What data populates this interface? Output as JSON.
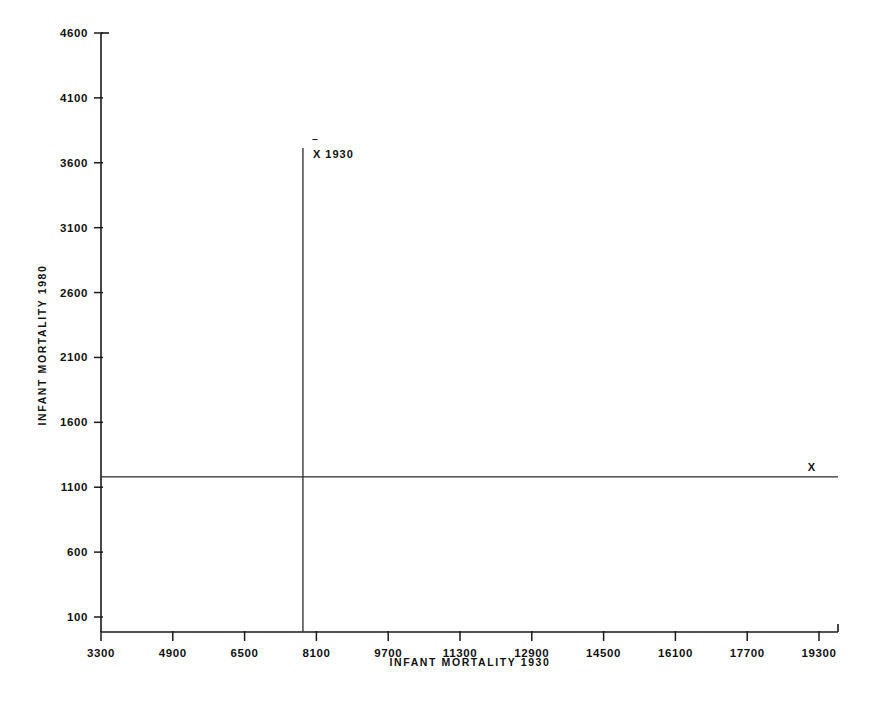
{
  "chart_data": {
    "type": "scatter",
    "title": "",
    "xlabel": "INFANT  MORTALITY  1930",
    "ylabel": "INFANT  MORTALITY  1980",
    "xlim": [
      3300,
      19300
    ],
    "ylim": [
      100,
      4600
    ],
    "grid": false,
    "legend": "none",
    "xticks": [
      "3300",
      "4900",
      "6500",
      "8100",
      "9700",
      "11300",
      "12900",
      "14500",
      "16100",
      "17700",
      "19300"
    ],
    "xtick_values": [
      3300,
      4900,
      6500,
      8100,
      9700,
      11300,
      12900,
      14500,
      16100,
      17700,
      19300
    ],
    "yticks": [
      "4600",
      "4100",
      "3600",
      "3100",
      "2600",
      "2100",
      "1600",
      "1100",
      "600",
      "100"
    ],
    "ytick_values": [
      4600,
      4100,
      3600,
      3100,
      2600,
      2100,
      1600,
      1100,
      600,
      100
    ],
    "reference_lines": [
      {
        "name": "mean-1930-vertical",
        "orientation": "vertical",
        "value": 7800,
        "label": "X 1930"
      },
      {
        "name": "mean-1980-horizontal",
        "orientation": "horizontal",
        "value": 1180,
        "label_top": "X",
        "label_bottom": "1980"
      }
    ],
    "band_lines": [
      {
        "name": "upper-band-line",
        "x0": 3300,
        "y0": 1010,
        "x1": 19700,
        "y1": 2790
      },
      {
        "name": "lower-band-line",
        "x0": 3300,
        "y0": 230,
        "x1": 19700,
        "y1": 2140
      }
    ],
    "annotations": [
      {
        "name": "region-increasingly-disadvantaged",
        "text": "INCREASINGLY  DISADVANTAGED",
        "x": 11350,
        "y": 2690
      },
      {
        "name": "region-reversal-to-disadvantaged-line1",
        "text": "REVERSAL",
        "x": 5450,
        "y": 1770
      },
      {
        "name": "region-reversal-to-disadvantaged-line2",
        "text": "to  DISADVANTAGED",
        "x": 5450,
        "y": 1640
      },
      {
        "name": "region-convergent-disadvantaged",
        "text": "CONVERGENT  DISADVANTAGED",
        "x": 16100,
        "y": 1330
      },
      {
        "name": "region-reversal-to-advantaged",
        "text": "REVERSAL  to  ADVANTAGED",
        "x": 14000,
        "y": 700
      },
      {
        "name": "region-increasingly-advantaged-line1",
        "text": "INCREASINGLY",
        "x": 5550,
        "y": 380
      },
      {
        "name": "region-increasingly-advantaged-line2",
        "text": "ADVANTAGED",
        "x": 5550,
        "y": 250
      }
    ],
    "points": [
      [
        3330,
        1095
      ],
      [
        3330,
        880
      ],
      [
        3560,
        810
      ],
      [
        3700,
        1030
      ],
      [
        3780,
        905
      ],
      [
        3820,
        725
      ],
      [
        3900,
        840
      ],
      [
        3960,
        640
      ],
      [
        4010,
        900
      ],
      [
        4060,
        770
      ],
      [
        4120,
        960
      ],
      [
        4150,
        700
      ],
      [
        4210,
        560
      ],
      [
        4260,
        845
      ],
      [
        4300,
        615
      ],
      [
        4330,
        990
      ],
      [
        4380,
        760
      ],
      [
        4420,
        880
      ],
      [
        4460,
        680
      ],
      [
        4500,
        930
      ],
      [
        4540,
        790
      ],
      [
        4580,
        600
      ],
      [
        4620,
        870
      ],
      [
        4660,
        740
      ],
      [
        4700,
        1010
      ],
      [
        4740,
        660
      ],
      [
        4780,
        820
      ],
      [
        4820,
        900
      ],
      [
        4860,
        580
      ],
      [
        4900,
        760
      ],
      [
        4950,
        930
      ],
      [
        4990,
        690
      ],
      [
        5030,
        850
      ],
      [
        5080,
        1000
      ],
      [
        5120,
        620
      ],
      [
        5160,
        790
      ],
      [
        5210,
        900
      ],
      [
        5250,
        700
      ],
      [
        5300,
        1080
      ],
      [
        5340,
        860
      ],
      [
        5380,
        640
      ],
      [
        5420,
        950
      ],
      [
        5460,
        780
      ],
      [
        5500,
        560
      ],
      [
        5560,
        880
      ],
      [
        5600,
        1020
      ],
      [
        5640,
        720
      ],
      [
        5690,
        840
      ],
      [
        5730,
        1150
      ],
      [
        5780,
        940
      ],
      [
        5820,
        620
      ],
      [
        5860,
        800
      ],
      [
        5900,
        1050
      ],
      [
        5950,
        700
      ],
      [
        6000,
        880
      ],
      [
        6050,
        1200
      ],
      [
        6100,
        760
      ],
      [
        6150,
        950
      ],
      [
        6200,
        470
      ],
      [
        6250,
        820
      ],
      [
        6300,
        1090
      ],
      [
        6350,
        660
      ],
      [
        6400,
        900
      ],
      [
        6450,
        1240
      ],
      [
        6500,
        770
      ],
      [
        6550,
        1000
      ],
      [
        6600,
        590
      ],
      [
        6650,
        860
      ],
      [
        6700,
        1160
      ],
      [
        6750,
        720
      ],
      [
        6800,
        980
      ],
      [
        6850,
        420
      ],
      [
        4500,
        1330
      ],
      [
        4900,
        1180
      ],
      [
        5350,
        1440
      ],
      [
        5700,
        1260
      ],
      [
        6000,
        1600
      ],
      [
        6250,
        1520
      ],
      [
        6450,
        1330
      ],
      [
        6700,
        1470
      ],
      [
        6850,
        1570
      ],
      [
        7000,
        1390
      ],
      [
        7150,
        1620
      ],
      [
        7300,
        1500
      ],
      [
        7400,
        1300
      ],
      [
        7500,
        1150
      ],
      [
        7550,
        1010
      ],
      [
        6100,
        330
      ],
      [
        6400,
        500
      ],
      [
        5800,
        440
      ],
      [
        5250,
        410
      ],
      [
        6900,
        190
      ],
      [
        7700,
        1560
      ],
      [
        7800,
        1440
      ],
      [
        7850,
        1240
      ],
      [
        7900,
        1130
      ],
      [
        7950,
        990
      ],
      [
        8000,
        1350
      ],
      [
        8100,
        1180
      ],
      [
        8150,
        1490
      ],
      [
        8200,
        1040
      ],
      [
        8250,
        1300
      ],
      [
        8300,
        1420
      ],
      [
        8350,
        1160
      ],
      [
        8400,
        880
      ],
      [
        8450,
        1510
      ],
      [
        8500,
        1260
      ],
      [
        8600,
        1380
      ],
      [
        8700,
        1090
      ],
      [
        8750,
        1620
      ],
      [
        8800,
        1430
      ],
      [
        8900,
        1240
      ],
      [
        9000,
        1520
      ],
      [
        9100,
        1340
      ],
      [
        9200,
        1150
      ],
      [
        9250,
        1600
      ],
      [
        9350,
        1410
      ],
      [
        9450,
        1290
      ],
      [
        9550,
        1500
      ],
      [
        9650,
        1380
      ],
      [
        9700,
        1180
      ],
      [
        9800,
        1560
      ],
      [
        9900,
        1300
      ],
      [
        10000,
        1420
      ],
      [
        10100,
        1620
      ],
      [
        10200,
        1250
      ],
      [
        10300,
        1480
      ],
      [
        10400,
        1340
      ],
      [
        10500,
        1160
      ],
      [
        10600,
        1390
      ],
      [
        10700,
        1540
      ],
      [
        10800,
        1210
      ],
      [
        8200,
        700
      ],
      [
        8400,
        620
      ],
      [
        8600,
        790
      ],
      [
        8800,
        560
      ],
      [
        9000,
        930
      ],
      [
        9200,
        840
      ],
      [
        9400,
        1000
      ],
      [
        9600,
        700
      ],
      [
        9800,
        880
      ],
      [
        10000,
        1050
      ],
      [
        10200,
        560
      ],
      [
        10400,
        960
      ],
      [
        10600,
        820
      ],
      [
        10800,
        1100
      ],
      [
        11000,
        900
      ],
      [
        10100,
        2060
      ],
      [
        10700,
        1950
      ],
      [
        11000,
        2100
      ],
      [
        11200,
        2240
      ],
      [
        11400,
        1900
      ],
      [
        11500,
        2060
      ],
      [
        11600,
        1560
      ],
      [
        11700,
        1300
      ],
      [
        11800,
        1430
      ],
      [
        11900,
        1650
      ],
      [
        12000,
        1200
      ],
      [
        12100,
        1520
      ],
      [
        12200,
        1100
      ],
      [
        12300,
        1350
      ],
      [
        12400,
        1000
      ],
      [
        12500,
        1230
      ],
      [
        12600,
        1460
      ],
      [
        12700,
        1150
      ],
      [
        12900,
        2820
      ],
      [
        13000,
        2250
      ],
      [
        13100,
        1200
      ],
      [
        13200,
        1840
      ],
      [
        13300,
        1330
      ],
      [
        13400,
        1180
      ],
      [
        13500,
        2240
      ],
      [
        13700,
        2150
      ],
      [
        14000,
        1230
      ],
      [
        14100,
        1800
      ],
      [
        14300,
        3470
      ],
      [
        14500,
        2170
      ],
      [
        14900,
        2000
      ],
      [
        15100,
        2010
      ],
      [
        15200,
        1500
      ],
      [
        15800,
        2750
      ],
      [
        15900,
        1840
      ],
      [
        18700,
        1800
      ],
      [
        11300,
        1380
      ],
      [
        11900,
        840
      ],
      [
        10500,
        580
      ],
      [
        12700,
        760
      ]
    ]
  },
  "figure": {
    "background": "#ffffff",
    "ink_color": "#111111",
    "point_marker": "filled-circle"
  }
}
